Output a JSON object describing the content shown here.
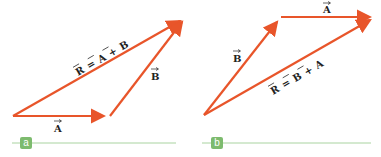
{
  "figure": {
    "colors": {
      "vector": "#e8552a",
      "baseline": "#a9d3a0",
      "tag_bg": "#7dbb6e",
      "text": "#222222"
    },
    "panels": [
      {
        "tag": "a",
        "vectors": [
          {
            "name": "A",
            "label": "A",
            "from": [
              13,
              116
            ],
            "to": [
              110,
              116
            ]
          },
          {
            "name": "B",
            "label": "B",
            "from": [
              110,
              116
            ],
            "to": [
              186,
              17
            ]
          },
          {
            "name": "R",
            "label": "R = A + B",
            "from": [
              13,
              116
            ],
            "to": [
              186,
              17
            ]
          }
        ],
        "equation": {
          "lhs": "R",
          "eq": "=",
          "t1": "A",
          "plus": "+",
          "t2": "B"
        }
      },
      {
        "tag": "b",
        "vectors": [
          {
            "name": "B",
            "label": "B",
            "from": [
              204,
              115
            ],
            "to": [
              281,
              17
            ]
          },
          {
            "name": "A",
            "label": "A",
            "from": [
              281,
              17
            ],
            "to": [
              376,
              17
            ]
          },
          {
            "name": "R",
            "label": "R = B + A",
            "from": [
              204,
              115
            ],
            "to": [
              376,
              17
            ]
          }
        ],
        "equation": {
          "lhs": "R",
          "eq": "=",
          "t1": "B",
          "plus": "+",
          "t2": "A"
        }
      }
    ]
  }
}
